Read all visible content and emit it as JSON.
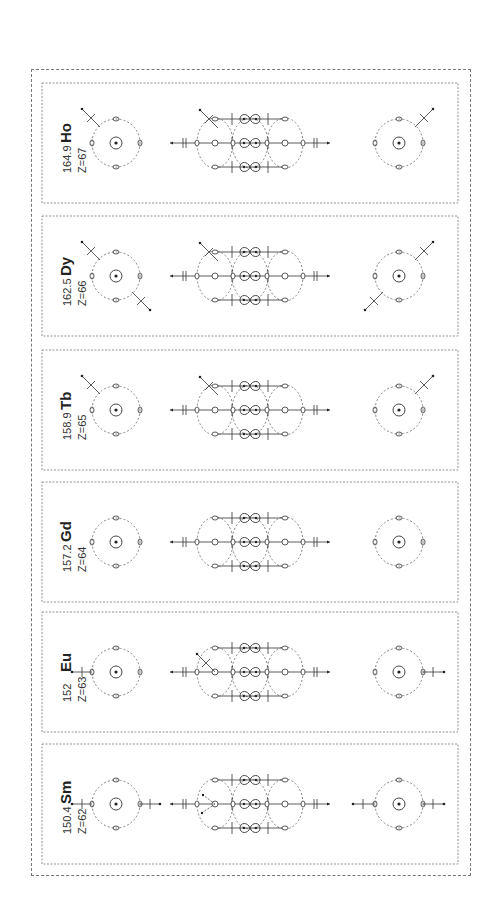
{
  "figure": {
    "panels": [
      {
        "symbol": "Ho",
        "mass": "164.9",
        "z": "Z=67"
      },
      {
        "symbol": "Dy",
        "mass": "162.5",
        "z": "Z=66"
      },
      {
        "symbol": "Tb",
        "mass": "158.9",
        "z": "Z=65"
      },
      {
        "symbol": "Gd",
        "mass": "157.2",
        "z": "Z=64"
      },
      {
        "symbol": "Eu",
        "mass": "152",
        "z": "Z=63"
      },
      {
        "symbol": "Sm",
        "mass": "150.4",
        "z": "Z=62"
      }
    ],
    "colors": {
      "line": "#333333",
      "dash": "#666666",
      "border": "#777777"
    }
  }
}
